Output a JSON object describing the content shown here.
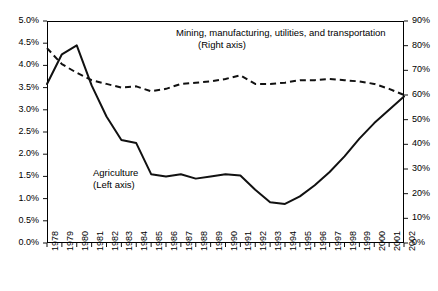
{
  "chart_data": {
    "type": "line",
    "title": "",
    "xlabel": "",
    "ylabel": "",
    "grid": false,
    "legend_position": "inline-annotations",
    "categories": [
      "1978",
      "1979",
      "1980",
      "1981",
      "1982",
      "1983",
      "1984",
      "1985",
      "1986",
      "1987",
      "1988",
      "1989",
      "1990",
      "1991",
      "1992",
      "1993",
      "1994",
      "1995",
      "1996",
      "1997",
      "1998",
      "1999",
      "2000",
      "2001",
      "2002"
    ],
    "left_axis": {
      "label": "",
      "ylim": [
        0,
        5
      ],
      "tick_step": 0.5,
      "tick_labels": [
        "0.0%",
        "0.5%",
        "1.0%",
        "1.5%",
        "2.0%",
        "2.5%",
        "3.0%",
        "3.5%",
        "4.0%",
        "4.5%",
        "5.0%"
      ],
      "unit": "%"
    },
    "right_axis": {
      "label": "",
      "ylim": [
        0,
        90
      ],
      "tick_step": 10,
      "tick_labels": [
        "0%",
        "10%",
        "20%",
        "30%",
        "40%",
        "50%",
        "60%",
        "70%",
        "80%",
        "90%"
      ],
      "unit": "%"
    },
    "series": [
      {
        "name": "Agriculture",
        "axis": "left",
        "style": "solid",
        "annotation": "Agriculture",
        "annotation_sub": "(Left axis)",
        "values": [
          3.58,
          4.25,
          4.45,
          3.55,
          2.85,
          2.32,
          2.25,
          1.55,
          1.5,
          1.55,
          1.45,
          1.5,
          1.55,
          1.52,
          1.2,
          0.92,
          0.88,
          1.05,
          1.3,
          1.6,
          1.95,
          2.35,
          2.7,
          3.0,
          3.3
        ]
      },
      {
        "name": "Mining, manufacturing, utilities, and transportation",
        "axis": "right",
        "style": "dashed",
        "annotation": "Mining, manufacturing, utilities, and transportation",
        "annotation_sub": "(Right axis)",
        "values": [
          79.0,
          72.5,
          69.0,
          66.0,
          64.5,
          63.0,
          63.5,
          61.5,
          62.5,
          64.5,
          65.0,
          65.5,
          66.5,
          68.0,
          64.5,
          64.5,
          65.0,
          66.0,
          66.0,
          66.5,
          66.0,
          65.5,
          64.5,
          62.5,
          60.0
        ]
      }
    ]
  },
  "annotations": {
    "agriculture": {
      "line1": "Agriculture",
      "line2": "(Left axis)"
    },
    "mining": {
      "line1": "Mining, manufacturing, utilities, and transportation",
      "line2": "(Right axis)"
    }
  }
}
